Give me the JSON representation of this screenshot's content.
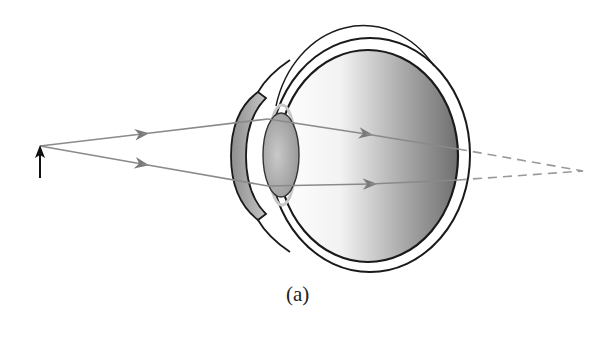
{
  "figure": {
    "caption_label": "(a)",
    "colors": {
      "ray": "#8a8a8a",
      "outline": "#1a1a1a",
      "eye_fill_dark": "#7d7d7d",
      "eye_fill_light": "#ffffff",
      "lens_fill": "#a8a8a8",
      "ciliary": "#c8c8c8",
      "object_arrow": "#111111"
    },
    "elements": [
      {
        "name": "object-arrow",
        "description": "Upright object arrow at left"
      },
      {
        "name": "ray-upper",
        "description": "Ray through upper part of lens, continues past retina as dashed"
      },
      {
        "name": "ray-lower",
        "description": "Ray through lower part of lens, continues past retina as dashed"
      },
      {
        "name": "cornea",
        "description": "Shaded curved cornea at front of eye"
      },
      {
        "name": "lens",
        "description": "Shaded elliptical crystalline lens"
      },
      {
        "name": "sclera",
        "description": "Outer double circle of eyeball"
      },
      {
        "name": "retina",
        "description": "Inner shaded region of eyeball"
      },
      {
        "name": "focal-point",
        "description": "Dashed rays converge behind the retina"
      }
    ]
  }
}
